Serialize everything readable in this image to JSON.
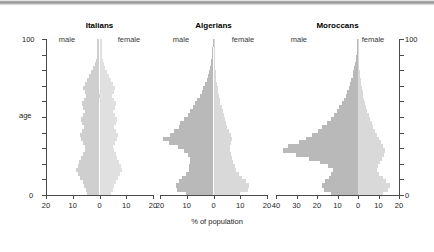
{
  "figure": {
    "caption": "% of population",
    "age_axis": {
      "label": "age",
      "min_label": "0",
      "max_label": "100",
      "min": 0,
      "max": 100,
      "tick_step": 10
    },
    "male_label": "male",
    "female_label": "female",
    "colors": {
      "male_bar": "#b9b9b9",
      "female_bar": "#d9d9d9",
      "male_bar_pale": "#cfcfcf",
      "female_bar_pale": "#e0e0e0",
      "axis": "#4a4a4a",
      "text": "#1d1d1d"
    }
  },
  "chart_data": {
    "type": "bar",
    "title": "",
    "subtitle": "",
    "xlabel": "% of population",
    "ylabel": "age",
    "ylim": [
      0,
      100
    ],
    "grid": false,
    "legend_position": "none",
    "orientation": "horizontal-back-to-back",
    "panels": [
      {
        "name": "Italians",
        "title": "Italians",
        "male_label": "male",
        "female_label": "female",
        "pale": true,
        "xlim": [
          20,
          20
        ],
        "xticks": [
          20,
          10,
          0,
          10,
          20
        ],
        "xticklabels": [
          "20",
          "10",
          "0",
          "10",
          "20"
        ],
        "age_bins": [
          0,
          2.5,
          5,
          7.5,
          10,
          12.5,
          15,
          17.5,
          20,
          22.5,
          25,
          27.5,
          30,
          32.5,
          35,
          37.5,
          40,
          42.5,
          45,
          47.5,
          50,
          52.5,
          55,
          57.5,
          60,
          62.5,
          65,
          67.5,
          70,
          72.5,
          75,
          77.5,
          80,
          82.5,
          85,
          87.5,
          90,
          92.5,
          95,
          97.5
        ],
        "series": [
          {
            "name": "male",
            "values": [
              4.6,
              5.2,
              5.8,
              6.2,
              7.4,
              8.1,
              8.6,
              8.2,
              7.6,
              7.0,
              6.2,
              5.6,
              5.4,
              6.2,
              6.8,
              7.2,
              6.6,
              5.8,
              6.4,
              7.0,
              6.2,
              5.4,
              6.0,
              6.6,
              5.8,
              5.0,
              5.6,
              6.2,
              5.4,
              4.6,
              3.8,
              3.0,
              2.4,
              1.8,
              1.4,
              1.0,
              0.8,
              0.8,
              0.8,
              0.8
            ]
          },
          {
            "name": "female",
            "values": [
              4.4,
              5.0,
              5.6,
              6.0,
              7.0,
              7.8,
              8.3,
              7.9,
              7.3,
              6.7,
              6.0,
              5.3,
              5.1,
              5.9,
              6.5,
              6.9,
              6.3,
              5.5,
              6.1,
              6.7,
              5.9,
              5.1,
              5.7,
              6.3,
              5.5,
              4.7,
              5.3,
              5.9,
              5.1,
              4.3,
              3.5,
              2.8,
              2.2,
              1.7,
              1.3,
              1.0,
              0.9,
              0.9,
              0.9,
              0.9
            ]
          }
        ]
      },
      {
        "name": "Algerians",
        "title": "Algerians",
        "male_label": "male",
        "female_label": "female",
        "pale": false,
        "xlim": [
          20,
          20
        ],
        "xticks": [
          20,
          10,
          0,
          10,
          20
        ],
        "xticklabels": [
          "20",
          "10",
          "0",
          "10",
          "20"
        ],
        "age_bins": [
          0,
          2.5,
          5,
          7.5,
          10,
          12.5,
          15,
          17.5,
          20,
          22.5,
          25,
          27.5,
          30,
          32.5,
          35,
          37.5,
          40,
          42.5,
          45,
          47.5,
          50,
          52.5,
          55,
          57.5,
          60,
          62.5,
          65,
          67.5,
          70,
          72.5,
          75,
          77.5,
          80,
          82.5,
          85,
          87.5,
          90,
          92.5,
          95,
          97.5
        ],
        "series": [
          {
            "name": "male",
            "values": [
              10.2,
              13.6,
              14.2,
              13.0,
              11.6,
              10.4,
              9.2,
              9.0,
              8.6,
              8.8,
              9.6,
              11.2,
              13.2,
              16.6,
              18.8,
              16.2,
              14.6,
              13.0,
              12.4,
              11.0,
              9.6,
              8.6,
              7.6,
              6.8,
              6.0,
              5.2,
              4.4,
              3.8,
              3.2,
              2.6,
              2.2,
              1.8,
              1.4,
              1.1,
              0.8,
              0.6,
              0.5,
              0.4,
              0.3,
              0.2
            ]
          },
          {
            "name": "female",
            "values": [
              10.0,
              12.8,
              13.4,
              12.2,
              10.8,
              9.6,
              8.4,
              8.0,
              7.4,
              6.8,
              6.4,
              6.2,
              6.0,
              6.4,
              6.8,
              6.4,
              5.8,
              5.2,
              4.8,
              4.2,
              3.8,
              3.4,
              3.0,
              2.6,
              2.3,
              2.0,
              1.7,
              1.5,
              1.3,
              1.1,
              0.9,
              0.8,
              0.6,
              0.5,
              0.4,
              0.3,
              0.2,
              0.2,
              0.1,
              0.1
            ]
          }
        ]
      },
      {
        "name": "Moroccans",
        "title": "Moroccans",
        "male_label": "male",
        "female_label": "female",
        "pale": false,
        "xlim": [
          40,
          20
        ],
        "xticks": [
          40,
          30,
          20,
          10,
          0,
          10,
          20
        ],
        "xticklabels": [
          "40",
          "30",
          "20",
          "10",
          "0",
          "10",
          "20"
        ],
        "age_bins": [
          0,
          2.5,
          5,
          7.5,
          10,
          12.5,
          15,
          17.5,
          20,
          22.5,
          25,
          27.5,
          30,
          32.5,
          35,
          37.5,
          40,
          42.5,
          45,
          47.5,
          50,
          52.5,
          55,
          57.5,
          60,
          62.5,
          65,
          67.5,
          70,
          72.5,
          75,
          77.5,
          80,
          82.5,
          85,
          87.5,
          90,
          92.5,
          95,
          97.5
        ],
        "series": [
          {
            "name": "male",
            "values": [
              13.0,
              16.4,
              17.6,
              16.0,
              14.2,
              13.0,
              12.4,
              14.8,
              18.6,
              24.0,
              30.2,
              36.8,
              34.0,
              28.6,
              25.2,
              22.4,
              19.6,
              17.4,
              15.2,
              13.4,
              11.8,
              10.4,
              9.2,
              8.0,
              7.0,
              6.0,
              5.2,
              4.4,
              3.8,
              3.2,
              2.6,
              2.2,
              1.8,
              1.4,
              1.1,
              0.8,
              0.6,
              0.5,
              0.4,
              0.3
            ]
          },
          {
            "name": "female",
            "values": [
              12.0,
              14.6,
              15.4,
              13.8,
              12.0,
              10.4,
              9.4,
              9.8,
              10.6,
              11.6,
              12.6,
              13.2,
              12.4,
              11.2,
              10.2,
              9.2,
              8.2,
              7.4,
              6.6,
              5.8,
              5.2,
              4.6,
              4.0,
              3.5,
              3.0,
              2.6,
              2.2,
              1.9,
              1.6,
              1.3,
              1.1,
              0.9,
              0.7,
              0.6,
              0.4,
              0.3,
              0.3,
              0.2,
              0.2,
              0.1
            ]
          }
        ]
      }
    ]
  }
}
